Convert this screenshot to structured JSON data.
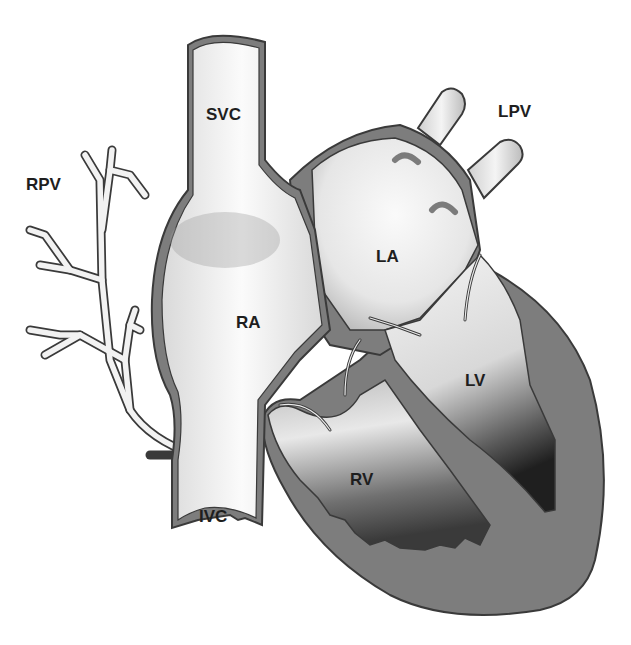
{
  "diagram": {
    "type": "heart-anatomy",
    "colors": {
      "outline": "#3a3a3a",
      "wall": "#7d7d7d",
      "chamber_light": "#f2f2f2",
      "chamber_dark": "#2e2e2e",
      "background": "#ffffff"
    },
    "labels": {
      "svc": "SVC",
      "rpv": "RPV",
      "lpv": "LPV",
      "la": "LA",
      "ra": "RA",
      "lv": "LV",
      "rv": "RV",
      "ivc": "IVC"
    }
  }
}
